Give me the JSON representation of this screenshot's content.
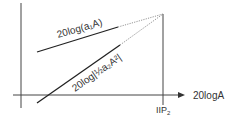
{
  "diagram": {
    "x_axis_label": "20logA",
    "iip2_label": "IIP",
    "iip2_subscript": "2",
    "line1_label": "20log(a₁A)",
    "line2_label": "20log|½a₂A²|",
    "colors": {
      "line": "#2a2a2a",
      "axis": "#3a3a3a",
      "dotted": "#777777"
    }
  }
}
